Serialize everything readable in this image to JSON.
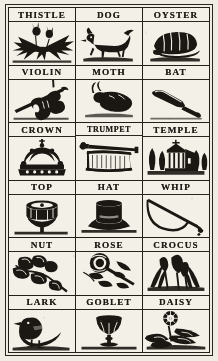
{
  "sheet": {
    "kind": "antique picture chart",
    "ink_color": "#1b1713",
    "paper_color": "#efece3",
    "columns": 3,
    "rows": 6
  },
  "cells": [
    {
      "label": "THISTLE",
      "icon": "thistle-plant-icon"
    },
    {
      "label": "DOG",
      "icon": "dog-icon"
    },
    {
      "label": "OYSTER",
      "icon": "oyster-shell-icon"
    },
    {
      "label": "VIOLIN",
      "icon": "violin-and-bow-icon"
    },
    {
      "label": "MOTH",
      "icon": "moth-icon"
    },
    {
      "label": "BAT",
      "icon": "cricket-bat-icon"
    },
    {
      "label": "CROWN",
      "icon": "crown-icon"
    },
    {
      "label": "TRUMPET",
      "icon": "trumpet-with-banner-icon"
    },
    {
      "label": "TEMPLE",
      "icon": "temple-building-icon"
    },
    {
      "label": "TOP",
      "icon": "spinning-top-icon"
    },
    {
      "label": "HAT",
      "icon": "top-hat-icon"
    },
    {
      "label": "WHIP",
      "icon": "whip-icon"
    },
    {
      "label": "NUT",
      "icon": "nut-branch-icon"
    },
    {
      "label": "ROSE",
      "icon": "rose-flower-icon"
    },
    {
      "label": "CROCUS",
      "icon": "crocus-flower-icon"
    },
    {
      "label": "LARK",
      "icon": "lark-bird-icon"
    },
    {
      "label": "GOBLET",
      "icon": "goblet-icon"
    },
    {
      "label": "DAISY",
      "icon": "daisy-flower-icon"
    }
  ]
}
